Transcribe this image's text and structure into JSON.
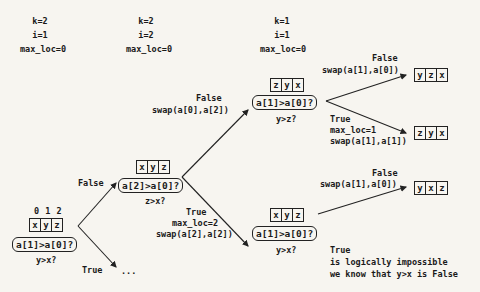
{
  "states": [
    {
      "k": "k=2",
      "i": "i=1",
      "max_loc": "max_loc=0"
    },
    {
      "k": "k=2",
      "i": "i=2",
      "max_loc": "max_loc=0"
    },
    {
      "k": "k=1",
      "i": "i=1",
      "max_loc": "max_loc=0"
    }
  ],
  "root": {
    "indices": "0 1 2",
    "array": [
      "x",
      "y",
      "z"
    ],
    "condition": "a[1]>a[0]?",
    "question": "y>x?",
    "true_label": "True",
    "true_target": "..."
  },
  "level2": {
    "edge_label": "False",
    "array": [
      "x",
      "y",
      "z"
    ],
    "condition": "a[2]>a[0]?",
    "question": "z>x?",
    "false_label": "False",
    "false_action": "swap(a[0],a[2])",
    "true_label": "True",
    "true_action1": "max_loc=2",
    "true_action2": "swap(a[2],a[2])"
  },
  "upper": {
    "array": [
      "z",
      "y",
      "x"
    ],
    "condition": "a[1]>a[0]?",
    "question": "y>z?",
    "false_label": "False",
    "false_action": "swap(a[1],a[0])",
    "false_result": [
      "y",
      "z",
      "x"
    ],
    "true_label": "True",
    "true_action1": "max_loc=1",
    "true_action2": "swap(a[1],a[1])",
    "true_result": [
      "z",
      "y",
      "x"
    ]
  },
  "lower": {
    "array": [
      "x",
      "y",
      "z"
    ],
    "condition": "a[1]>a[0]?",
    "question": "y>x?",
    "false_label": "False",
    "false_action": "swap(a[1],a[0])",
    "false_result": [
      "y",
      "x",
      "z"
    ],
    "true_label": "True",
    "true_note1": "is logically impossible",
    "true_note2": "we know that y>x is False"
  }
}
